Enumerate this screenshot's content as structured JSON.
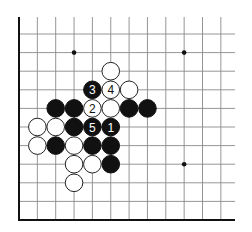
{
  "board": {
    "type": "go-diagram-corner",
    "corner": "lower-left",
    "grid": {
      "origin_x": 19,
      "origin_y": 34,
      "spacing_x": 18.35,
      "spacing_y": 18.6,
      "cols": 12,
      "rows": 11,
      "right_extent": 235,
      "top_extent": 17,
      "bottom_y": 220
    },
    "star_points": [
      {
        "col": 3,
        "row": 1
      },
      {
        "col": 9,
        "row": 1
      },
      {
        "col": 9,
        "row": 7
      }
    ],
    "stones": [
      {
        "col": 5,
        "row": 2,
        "color": "white",
        "label": ""
      },
      {
        "col": 4,
        "row": 3,
        "color": "black",
        "label": "3"
      },
      {
        "col": 5,
        "row": 3,
        "color": "white",
        "label": "4"
      },
      {
        "col": 6,
        "row": 3,
        "color": "white",
        "label": ""
      },
      {
        "col": 2,
        "row": 4,
        "color": "black",
        "label": ""
      },
      {
        "col": 3,
        "row": 4,
        "color": "black",
        "label": ""
      },
      {
        "col": 4,
        "row": 4,
        "color": "white",
        "label": "2"
      },
      {
        "col": 5,
        "row": 4,
        "color": "white",
        "label": ""
      },
      {
        "col": 6,
        "row": 4,
        "color": "black",
        "label": ""
      },
      {
        "col": 7,
        "row": 4,
        "color": "black",
        "label": ""
      },
      {
        "col": 1,
        "row": 5,
        "color": "white",
        "label": ""
      },
      {
        "col": 2,
        "row": 5,
        "color": "white",
        "label": ""
      },
      {
        "col": 3,
        "row": 5,
        "color": "black",
        "label": ""
      },
      {
        "col": 4,
        "row": 5,
        "color": "black",
        "label": "5"
      },
      {
        "col": 5,
        "row": 5,
        "color": "black",
        "label": "1"
      },
      {
        "col": 1,
        "row": 6,
        "color": "white",
        "label": ""
      },
      {
        "col": 2,
        "row": 6,
        "color": "black",
        "label": ""
      },
      {
        "col": 3,
        "row": 6,
        "color": "white",
        "label": ""
      },
      {
        "col": 4,
        "row": 6,
        "color": "black",
        "label": ""
      },
      {
        "col": 5,
        "row": 6,
        "color": "black",
        "label": ""
      },
      {
        "col": 3,
        "row": 7,
        "color": "white",
        "label": ""
      },
      {
        "col": 4,
        "row": 7,
        "color": "white",
        "label": ""
      },
      {
        "col": 5,
        "row": 7,
        "color": "black",
        "label": ""
      },
      {
        "col": 3,
        "row": 8,
        "color": "white",
        "label": ""
      }
    ],
    "move_sequence": [
      {
        "move": 1,
        "color": "black"
      },
      {
        "move": 2,
        "color": "white"
      },
      {
        "move": 3,
        "color": "black"
      },
      {
        "move": 4,
        "color": "white"
      },
      {
        "move": 5,
        "color": "black"
      }
    ],
    "colors": {
      "black_stone": "#111111",
      "white_stone": "#ffffff",
      "grid": "#8a8a8a",
      "edge": "#111111"
    }
  }
}
